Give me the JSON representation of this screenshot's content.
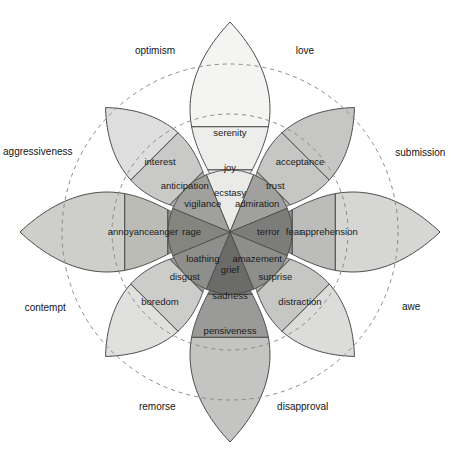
{
  "figure": {
    "caption": "",
    "geometry": {
      "center_x": 230,
      "center_y": 232,
      "cardinal_tip": 210,
      "diagonal_tip": 176,
      "ring_inner": 62,
      "ring_mid": 112,
      "guide_circle_inner": 118,
      "guide_circle_outer": 168,
      "petal_half_width_deg": 21
    },
    "palette": {
      "light_yellow": "#eeeeec",
      "pale": "#e3e3e1",
      "mid_light": "#c9c9c7",
      "mid": "#b5b5b3",
      "mid_dark": "#9d9d9b",
      "dark": "#848482",
      "darker": "#6f6f6d",
      "darkest": "#5e5e5c",
      "outline": "#4c4c4c",
      "dash": "#8a8a8a",
      "text": "#1a1a1a",
      "background": "#ffffff"
    }
  },
  "petals": [
    {
      "id": "joy-axis",
      "angle_deg": -90,
      "kind": "cardinal",
      "intense": {
        "label": "ecstasy",
        "color": "#eaeae8"
      },
      "basic": {
        "label": "joy",
        "color": "#e6e6e4"
      },
      "mild": {
        "label": "serenity",
        "color": "#ededeb"
      },
      "tipcolor": "#f4f4f2"
    },
    {
      "id": "trust-axis",
      "angle_deg": -45,
      "kind": "diagonal",
      "intense": {
        "label": "admiration",
        "color": "#a0a09e"
      },
      "basic": {
        "label": "trust",
        "color": "#b4b4b2"
      },
      "mild": {
        "label": "acceptance",
        "color": "#c6c6c4"
      },
      "tipcolor": "#c6c6c4"
    },
    {
      "id": "fear-axis",
      "angle_deg": 0,
      "kind": "cardinal",
      "intense": {
        "label": "terror",
        "color": "#7c7c7a"
      },
      "basic": {
        "label": "fear",
        "color": "#8e8e8c"
      },
      "mild": {
        "label": "apprehension",
        "color": "#bcbcba"
      },
      "tipcolor": "#d6d6d4"
    },
    {
      "id": "surprise-axis",
      "angle_deg": 45,
      "kind": "diagonal",
      "intense": {
        "label": "amazement",
        "color": "#8e8e8c"
      },
      "basic": {
        "label": "surprise",
        "color": "#aeaeac"
      },
      "mild": {
        "label": "distraction",
        "color": "#c6c6c4"
      },
      "tipcolor": "#dcdcda"
    },
    {
      "id": "sadness-axis",
      "angle_deg": 90,
      "kind": "cardinal",
      "intense": {
        "label": "grief",
        "color": "#6b6b69"
      },
      "basic": {
        "label": "sadness",
        "color": "#7c7c7a"
      },
      "mild": {
        "label": "pensiveness",
        "color": "#9a9a98"
      },
      "tipcolor": "#c4c4c2"
    },
    {
      "id": "disgust-axis",
      "angle_deg": 135,
      "kind": "diagonal",
      "intense": {
        "label": "loathing",
        "color": "#8e8e8c"
      },
      "basic": {
        "label": "disgust",
        "color": "#9d9d9b"
      },
      "mild": {
        "label": "boredom",
        "color": "#cccccA"
      },
      "tipcolor": "#e0e0de"
    },
    {
      "id": "anger-axis",
      "angle_deg": 180,
      "kind": "cardinal",
      "intense": {
        "label": "rage",
        "color": "#85857f"
      },
      "basic": {
        "label": "anger",
        "color": "#92928c"
      },
      "mild": {
        "label": "annoyance",
        "color": "#bcbcb6"
      },
      "tipcolor": "#cececa"
    },
    {
      "id": "anticipation-axis",
      "angle_deg": -135,
      "kind": "diagonal",
      "intense": {
        "label": "vigilance",
        "color": "#a0a09e"
      },
      "basic": {
        "label": "anticipation",
        "color": "#b0b0ae"
      },
      "mild": {
        "label": "interest",
        "color": "#c9c9c7"
      },
      "tipcolor": "#dedede"
    }
  ],
  "dyads": [
    {
      "id": "love",
      "label": "love",
      "angle_deg": -67.5,
      "radius": 196
    },
    {
      "id": "submission",
      "label": "submission",
      "angle_deg": -22.5,
      "radius": 206
    },
    {
      "id": "awe",
      "label": "awe",
      "angle_deg": 22.5,
      "radius": 196
    },
    {
      "id": "disapproval",
      "label": "disapproval",
      "angle_deg": 67.5,
      "radius": 190
    },
    {
      "id": "remorse",
      "label": "remorse",
      "angle_deg": 112.5,
      "radius": 190
    },
    {
      "id": "contempt",
      "label": "contempt",
      "angle_deg": 157.5,
      "radius": 200
    },
    {
      "id": "aggressiveness",
      "label": "aggressiveness",
      "angle_deg": 202.5,
      "radius": 208
    },
    {
      "id": "optimism",
      "label": "optimism",
      "angle_deg": 247.5,
      "radius": 196
    }
  ]
}
